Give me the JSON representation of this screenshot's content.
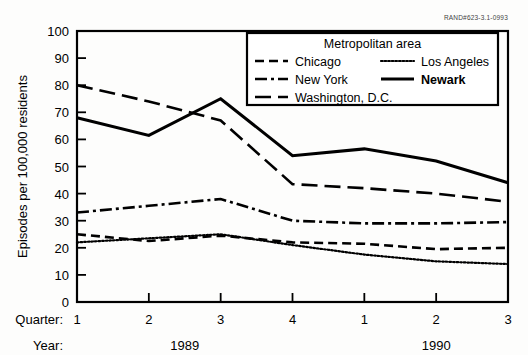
{
  "source_id": "RAND#623-3.1-0993",
  "axes": {
    "ylabel": "Episodes per 100,000 residents",
    "yticks": [
      "0",
      "10",
      "20",
      "30",
      "40",
      "50",
      "60",
      "70",
      "80",
      "90",
      "100"
    ],
    "quarter_row_label": "Quarter:",
    "year_row_label": "Year:",
    "quarter_ticks": [
      "1",
      "2",
      "3",
      "4",
      "1",
      "2",
      "3"
    ],
    "year_groups": [
      {
        "label": "1989",
        "center_index": 1.5
      },
      {
        "label": "1990",
        "center_index": 5.0
      }
    ]
  },
  "legend": {
    "title": "Metropolitan area",
    "entries": [
      {
        "label": "Chicago",
        "style": "dashed",
        "bold": false
      },
      {
        "label": "New York",
        "style": "dash-dot",
        "bold": false
      },
      {
        "label": "Washington, D.C.",
        "style": "long-dash",
        "bold": false
      },
      {
        "label": "Los Angeles",
        "style": "dotted",
        "bold": false
      },
      {
        "label": "Newark",
        "style": "solid",
        "bold": true
      }
    ]
  },
  "chart_data": {
    "type": "line",
    "title": "",
    "xlabel": "Quarter / Year",
    "ylabel": "Episodes per 100,000 residents",
    "ylim": [
      0,
      100
    ],
    "ytick_step": 10,
    "grid": false,
    "legend_position": "top-right-inside",
    "categories": [
      "1989 Q1",
      "1989 Q2",
      "1989 Q3",
      "1989 Q4",
      "1990 Q1",
      "1990 Q2",
      "1990 Q3"
    ],
    "x": [
      1,
      2,
      3,
      4,
      5,
      6,
      7
    ],
    "series": [
      {
        "name": "Washington, D.C.",
        "style": "long-dash",
        "values": [
          80,
          74,
          67,
          43.5,
          42,
          40,
          37
        ]
      },
      {
        "name": "Newark",
        "style": "solid",
        "values": [
          68,
          61.5,
          75,
          54,
          56.5,
          52,
          44
        ]
      },
      {
        "name": "New York",
        "style": "dash-dot",
        "values": [
          33,
          35.5,
          38,
          30,
          29,
          29,
          29.5
        ]
      },
      {
        "name": "Chicago",
        "style": "dashed",
        "values": [
          25,
          22.5,
          24.5,
          22,
          21.5,
          19.5,
          20
        ]
      },
      {
        "name": "Los Angeles",
        "style": "dotted",
        "values": [
          22,
          23.5,
          25,
          21,
          17.5,
          15,
          14
        ]
      }
    ]
  }
}
